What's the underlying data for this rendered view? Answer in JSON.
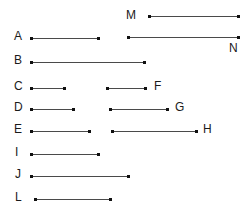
{
  "diagram": {
    "type": "segment-diagram",
    "background_color": "#ffffff",
    "line_color": "#4a4a4a",
    "endpoint_color": "#111111",
    "label_color": "#1a1a1a",
    "canvas": {
      "width": 252,
      "height": 217
    },
    "segments": [
      {
        "label": "M",
        "label_x": 126,
        "label_y": 9,
        "label_position": "left",
        "x1": 149,
        "x2": 238,
        "y": 16,
        "length": 89
      },
      {
        "label": "A",
        "label_x": 14,
        "label_y": 30,
        "label_position": "left",
        "x1": 31,
        "x2": 98,
        "y": 38,
        "length": 67
      },
      {
        "label": "N",
        "label_x": 229,
        "label_y": 42,
        "label_position": "below-right",
        "x1": 128,
        "x2": 238,
        "y": 37,
        "length": 110
      },
      {
        "label": "B",
        "label_x": 14,
        "label_y": 54,
        "label_position": "left",
        "x1": 31,
        "x2": 144,
        "y": 62,
        "length": 113
      },
      {
        "label": "C",
        "label_x": 14,
        "label_y": 80,
        "label_position": "left",
        "x1": 31,
        "x2": 64,
        "y": 88,
        "length": 33
      },
      {
        "label": "F",
        "label_x": 154,
        "label_y": 80,
        "label_position": "right",
        "x1": 107,
        "x2": 145,
        "y": 88,
        "length": 38
      },
      {
        "label": "D",
        "label_x": 14,
        "label_y": 101,
        "label_position": "left",
        "x1": 31,
        "x2": 73,
        "y": 109,
        "length": 42
      },
      {
        "label": "G",
        "label_x": 175,
        "label_y": 101,
        "label_position": "right",
        "x1": 110,
        "x2": 167,
        "y": 109,
        "length": 57
      },
      {
        "label": "E",
        "label_x": 14,
        "label_y": 123,
        "label_position": "left",
        "x1": 31,
        "x2": 89,
        "y": 131,
        "length": 58
      },
      {
        "label": "H",
        "label_x": 203,
        "label_y": 123,
        "label_position": "right",
        "x1": 112,
        "x2": 196,
        "y": 131,
        "length": 84
      },
      {
        "label": "I",
        "label_x": 15,
        "label_y": 146,
        "label_position": "left",
        "x1": 31,
        "x2": 98,
        "y": 154,
        "length": 67
      },
      {
        "label": "J",
        "label_x": 15,
        "label_y": 168,
        "label_position": "left",
        "x1": 31,
        "x2": 128,
        "y": 176,
        "length": 97
      },
      {
        "label": "L",
        "label_x": 15,
        "label_y": 191,
        "label_position": "left",
        "x1": 35,
        "x2": 110,
        "y": 199,
        "length": 75
      }
    ]
  }
}
